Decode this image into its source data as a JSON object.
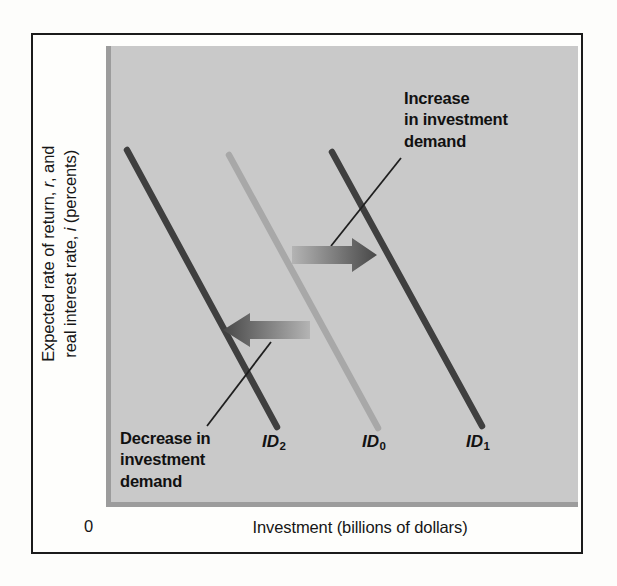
{
  "figure": {
    "panel_color": "#c9c9c9",
    "frame_color": "#1b1b1b"
  },
  "axes": {
    "y_label_line1": "Expected rate of return, r, and",
    "y_label_line2": "real interest rate, i (percents)",
    "y_label_italic_1": "r",
    "y_label_italic_2": "i",
    "x_label": "Investment (billions of dollars)",
    "origin": "0"
  },
  "annotations": [
    {
      "name": "increase-annotation",
      "line1": "Increase",
      "line2": "in investment",
      "line3": "demand"
    },
    {
      "name": "decrease-annotation",
      "line1": "Decrease in",
      "line2": "investment",
      "line3": "demand"
    }
  ],
  "curve_labels": {
    "id2_base": "ID",
    "id2_sub": "2",
    "id0_base": "ID",
    "id0_sub": "0",
    "id1_base": "ID",
    "id1_sub": "1"
  },
  "chart_data": {
    "type": "line",
    "title": "",
    "xlabel": "Investment (billions of dollars)",
    "ylabel": "Expected rate of return, r, and real interest rate, i (percents)",
    "xlim": [
      0,
      100
    ],
    "ylim": [
      0,
      100
    ],
    "grid": false,
    "legend": "inline-curve-labels",
    "axis_ticks": {
      "x": [],
      "y": [],
      "origin_label": "0"
    },
    "series": [
      {
        "name": "ID2",
        "label": "ID₂",
        "description": "Investment demand after a decrease in investment demand (leftmost curve)",
        "color": "#3f3f3f",
        "stroke_width": 6,
        "points_px": [
          [
            127,
            150
          ],
          [
            277,
            427
          ]
        ],
        "points_data": [
          [
            4,
            88
          ],
          [
            36,
            22
          ]
        ]
      },
      {
        "name": "ID0",
        "label": "ID₀",
        "description": "Original investment demand curve (center)",
        "color": "#a8a8a8",
        "stroke_width": 6,
        "points_px": [
          [
            229,
            155
          ],
          [
            378,
            428
          ]
        ],
        "points_data": [
          [
            26,
            87
          ],
          [
            58,
            21
          ]
        ]
      },
      {
        "name": "ID1",
        "label": "ID₁",
        "description": "Investment demand after an increase in investment demand (rightmost curve)",
        "color": "#3f3f3f",
        "stroke_width": 6,
        "points_px": [
          [
            332,
            152
          ],
          [
            482,
            426
          ]
        ],
        "points_data": [
          [
            48,
            88
          ],
          [
            80,
            22
          ]
        ]
      }
    ],
    "shift_arrows": [
      {
        "name": "increase-arrow",
        "direction": "right",
        "meaning": "Increase in investment demand: ID0 shifts right to ID1",
        "from_px": [
          292,
          255
        ],
        "to_px": [
          376,
          255
        ],
        "gradient_from": "#b0b0b0",
        "gradient_to": "#4a4a4a"
      },
      {
        "name": "decrease-arrow",
        "direction": "left",
        "meaning": "Decrease in investment demand: ID0 shifts left to ID2",
        "from_px": [
          310,
          330
        ],
        "to_px": [
          222,
          330
        ],
        "gradient_from": "#b0b0b0",
        "gradient_to": "#4a4a4a"
      }
    ],
    "leader_lines": [
      {
        "name": "increase-leader-line",
        "from_px": [
          331,
          246
        ],
        "to_px": [
          401,
          158
        ]
      },
      {
        "name": "decrease-leader-line",
        "from_px": [
          207,
          426
        ],
        "to_px": [
          271,
          342
        ]
      }
    ]
  }
}
